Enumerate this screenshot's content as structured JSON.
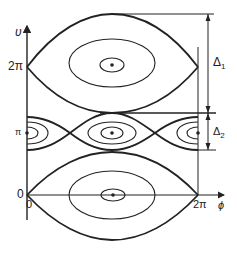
{
  "diagram": {
    "type": "phase-space portrait (pendulum-like resonances)",
    "axes": {
      "y_label": "υ",
      "x_label": "ϕ",
      "y_ticks": [
        "2π",
        "π",
        "0"
      ],
      "x_ticks": [
        "0",
        "2π"
      ]
    },
    "annotations": {
      "delta1": "Δ",
      "delta1_sub": "1",
      "delta2": "Δ",
      "delta2_sub": "2"
    },
    "resonances": [
      {
        "name": "resonance-2pi",
        "center_v": "2π",
        "width_label": "Δ1"
      },
      {
        "name": "resonance-pi",
        "center_v": "π",
        "width_label": "Δ2"
      },
      {
        "name": "resonance-0",
        "center_v": "0"
      }
    ],
    "colors": {
      "line": "#222222",
      "background": "#ffffff"
    }
  }
}
